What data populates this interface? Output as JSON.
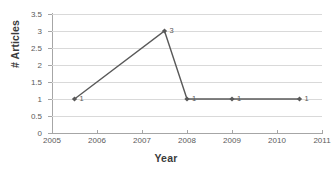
{
  "chart_data": {
    "type": "line",
    "title": "",
    "xlabel": "Year",
    "ylabel": "# Articles",
    "xlim": [
      2005,
      2011
    ],
    "ylim": [
      0,
      3.5
    ],
    "grid": true,
    "legend": false,
    "legend_position": "none",
    "series": [
      {
        "name": "# Articles",
        "color": "#595959",
        "marker": "diamond",
        "x": [
          2005.5,
          2007.5,
          2008,
          2009,
          2010.5
        ],
        "values": [
          1,
          3,
          1,
          1,
          1
        ],
        "point_labels": [
          "1",
          "3",
          "1",
          "1",
          "1"
        ]
      }
    ],
    "xticks": [
      2005,
      2006,
      2007,
      2008,
      2009,
      2010,
      2011
    ],
    "xticklabels": [
      "2005",
      "2006",
      "2007",
      "2008",
      "2009",
      "2010",
      "2011"
    ],
    "yticks": [
      0,
      0.5,
      1,
      1.5,
      2,
      2.5,
      3,
      3.5
    ],
    "yticklabels": [
      "0",
      "0.5",
      "1",
      "1.5",
      "2",
      "2.5",
      "3",
      "3.5"
    ],
    "colors": {
      "series": "#595959",
      "gridline": "#d9d9d9",
      "axis": "#a6a6a6",
      "tick_text": "#5a5a5a",
      "axis_title": "#3b3b3b",
      "background": "#ffffff"
    }
  }
}
